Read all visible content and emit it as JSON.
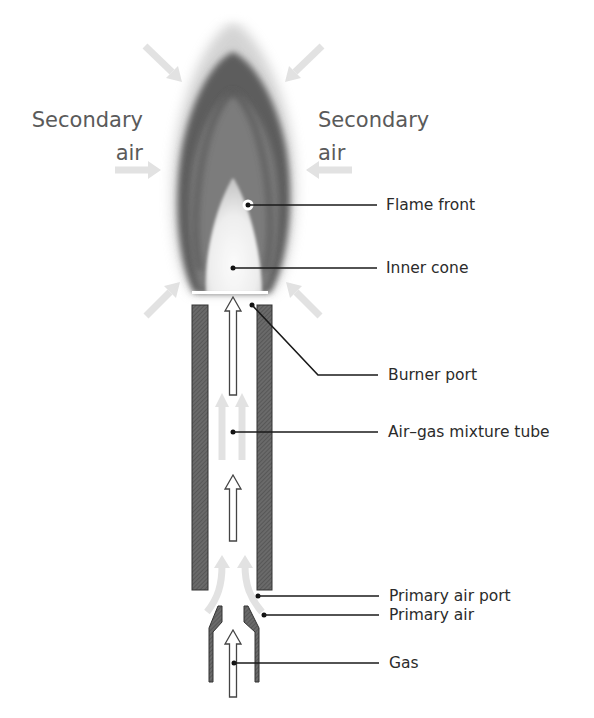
{
  "diagram": {
    "secondary_air_left": {
      "line1": "Secondary",
      "line2": "air"
    },
    "secondary_air_right": {
      "line1": "Secondary",
      "line2": "air"
    },
    "labels": {
      "flame_front": "Flame front",
      "inner_cone": "Inner cone",
      "burner_port": "Burner port",
      "mixture_tube": "Air–gas mixture tube",
      "primary_air_port": "Primary air port",
      "primary_air": "Primary air",
      "gas": "Gas"
    },
    "colors": {
      "flame_dark": "#3c3c3c",
      "flame_mid": "#7a7a7a",
      "inner_cone": "#f2f2f2",
      "air_arrows": "#e2e2e2",
      "tube_wall": "#5e5e5e",
      "text": "#2b2b2b",
      "secondary_text": "#5a5a5a"
    }
  }
}
